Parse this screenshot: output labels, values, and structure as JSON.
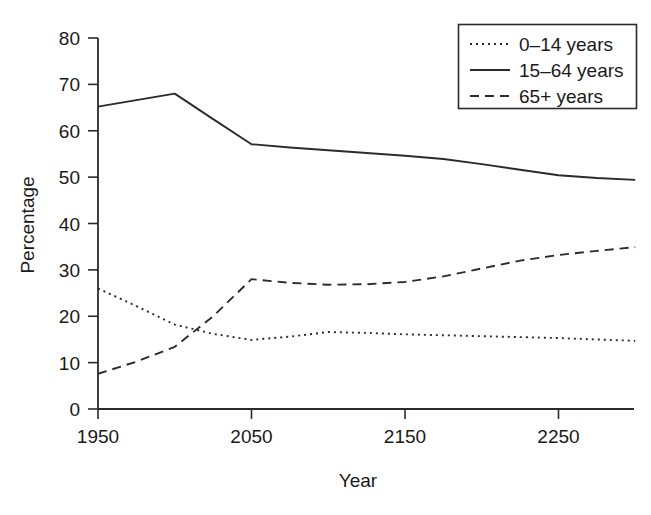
{
  "chart_data": {
    "type": "line",
    "title": "",
    "xlabel": "Year",
    "ylabel": "Percentage",
    "xlim": [
      1950,
      2300
    ],
    "ylim": [
      0,
      80
    ],
    "xticks": [
      1950,
      2050,
      2150,
      2250
    ],
    "yticks": [
      0,
      10,
      20,
      30,
      40,
      50,
      60,
      70,
      80
    ],
    "xtick_labels": [
      "1950",
      "2050",
      "2150",
      "2250"
    ],
    "ytick_labels": [
      "0",
      "10",
      "20",
      "30",
      "40",
      "50",
      "60",
      "70",
      "80"
    ],
    "grid": false,
    "legend_position": "top-right",
    "x": [
      1950,
      1975,
      2000,
      2025,
      2050,
      2075,
      2100,
      2125,
      2150,
      2175,
      2200,
      2225,
      2250,
      2275,
      2300
    ],
    "series": [
      {
        "name": "0–14 years",
        "style": "dotted",
        "values": [
          26.0,
          22.2,
          18.2,
          16.2,
          14.9,
          15.6,
          16.6,
          16.4,
          16.1,
          15.9,
          15.7,
          15.5,
          15.3,
          15.0,
          14.7
        ]
      },
      {
        "name": "15–64 years",
        "style": "solid",
        "values": [
          65.2,
          66.6,
          68.0,
          62.5,
          57.1,
          56.4,
          55.8,
          55.2,
          54.6,
          53.9,
          52.8,
          51.6,
          50.4,
          49.8,
          49.4
        ]
      },
      {
        "name": "65+ years",
        "style": "dashed",
        "values": [
          7.6,
          10.2,
          13.4,
          20.0,
          28.0,
          27.2,
          26.8,
          26.9,
          27.4,
          28.6,
          30.3,
          32.0,
          33.2,
          34.1,
          34.9
        ]
      }
    ]
  },
  "legend": {
    "items": [
      {
        "label": "0–14 years",
        "style": "dotted"
      },
      {
        "label": "15–64 years",
        "style": "solid"
      },
      {
        "label": "65+ years",
        "style": "dashed"
      }
    ]
  },
  "axes": {
    "y_title": "Percentage",
    "x_title": "Year"
  }
}
